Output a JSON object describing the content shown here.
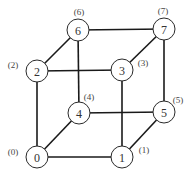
{
  "diagram": {
    "type": "hypercube-graph",
    "nodes": [
      {
        "id": "0",
        "label": "(0)",
        "x": 37,
        "y": 157,
        "lx": 13,
        "ly": 152
      },
      {
        "id": "1",
        "label": "(1)",
        "x": 122,
        "y": 157,
        "lx": 144,
        "ly": 150
      },
      {
        "id": "2",
        "label": "(2)",
        "x": 37,
        "y": 71,
        "lx": 13,
        "ly": 65
      },
      {
        "id": "3",
        "label": "(3)",
        "x": 122,
        "y": 70,
        "lx": 143,
        "ly": 63
      },
      {
        "id": "4",
        "label": "(4)",
        "x": 79,
        "y": 113,
        "lx": 89,
        "ly": 97
      },
      {
        "id": "5",
        "label": "(5)",
        "x": 164,
        "y": 112,
        "lx": 178,
        "ly": 100
      },
      {
        "id": "6",
        "label": "(6)",
        "x": 78,
        "y": 30,
        "lx": 79,
        "ly": 12
      },
      {
        "id": "7",
        "label": "(7)",
        "x": 164,
        "y": 29,
        "lx": 163,
        "ly": 11
      }
    ],
    "edges": [
      [
        "0",
        "1"
      ],
      [
        "0",
        "2"
      ],
      [
        "0",
        "4"
      ],
      [
        "1",
        "3"
      ],
      [
        "1",
        "5"
      ],
      [
        "2",
        "3"
      ],
      [
        "2",
        "6"
      ],
      [
        "3",
        "7"
      ],
      [
        "4",
        "5"
      ],
      [
        "4",
        "6"
      ],
      [
        "5",
        "7"
      ],
      [
        "6",
        "7"
      ]
    ],
    "node_radius": 11,
    "colors": {
      "edge": "#1a1a1a",
      "node_stroke": "#2a2a2a",
      "node_fill": "#ffffff",
      "text": "#333333"
    }
  }
}
